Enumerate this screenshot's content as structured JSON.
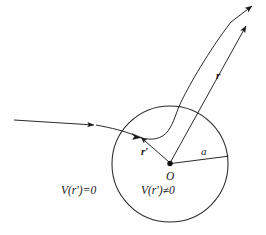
{
  "figure": {
    "type": "scattering-potential-diagram",
    "background_color": "#fefefe",
    "stroke_color": "#1a1a1a",
    "labels": {
      "origin": "O",
      "radius": "a",
      "vector_r": "r",
      "vector_r_prime": "r′",
      "region_outside": "V(r′)=0",
      "region_inside": "V(r′)≠0"
    },
    "elements": {
      "circle": {
        "name": "potential-region-circle",
        "center_x": 170,
        "center_y": 164,
        "radius": 58
      },
      "center_dot": {
        "name": "origin-point",
        "x": 170,
        "y": 164
      },
      "radius_line": {
        "name": "radius-segment-a",
        "from_x": 170,
        "from_y": 164,
        "to_x": 228,
        "to_y": 156
      },
      "vector_r_prime": {
        "name": "vector-r-prime",
        "from_x": 170,
        "from_y": 164,
        "to_x": 139,
        "to_y": 136
      },
      "vector_r": {
        "name": "vector-r",
        "from_x": 170,
        "from_y": 164,
        "to_x": 254,
        "to_y": 16
      },
      "incoming_trajectory": {
        "name": "incoming-particle-path",
        "start_x": 14,
        "start_y": 120,
        "arrow_x": 96,
        "arrow_y": 125
      },
      "outgoing_trajectory": {
        "name": "outgoing-particle-path",
        "end_x": 256,
        "end_y": 12
      }
    }
  }
}
